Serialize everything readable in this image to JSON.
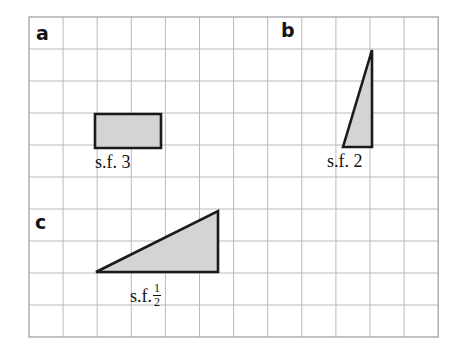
{
  "page": {
    "background_color": "#ffffff",
    "width": 454,
    "height": 355
  },
  "grid": {
    "name": "square-grid",
    "origin_x": 29,
    "origin_y": 17,
    "cell_size": 34.1,
    "cell_size_y": 32.0,
    "columns": 12,
    "rows": 10,
    "line_color": "#b9b9c4",
    "border_color": "#9a9aa6",
    "line_width": 1
  },
  "style": {
    "shape_fill": "#d4d4d4",
    "shape_stroke": "#1a1a1a",
    "shape_stroke_width": 2.6,
    "text_color": "#121212"
  },
  "parts": [
    {
      "id": "a",
      "letter": "a",
      "letter_x": 36,
      "letter_y": 24,
      "shape": {
        "type": "rectangle",
        "name": "shape-rectangle-a",
        "points": "95,114 161,114 161,148 95,148",
        "grid_width_cells": 2,
        "grid_height_cells": 1
      },
      "label": {
        "text": "s.f.",
        "value": "3",
        "fraction": null,
        "x": 95,
        "y": 153
      }
    },
    {
      "id": "b",
      "letter": "b",
      "letter_x": 281,
      "letter_y": 21,
      "shape": {
        "type": "triangle",
        "name": "shape-triangle-b",
        "points": "372,50 372,147 343,147",
        "grid_width_cells": 1,
        "grid_height_cells": 3
      },
      "label": {
        "text": "s.f.",
        "value": "2",
        "fraction": null,
        "x": 327,
        "y": 152
      }
    },
    {
      "id": "c",
      "letter": "c",
      "letter_x": 35,
      "letter_y": 213,
      "shape": {
        "type": "triangle",
        "name": "shape-triangle-c",
        "points": "96,272 218,272 218,211",
        "grid_width_cells": 4,
        "grid_height_cells": 2
      },
      "label": {
        "text": "s.f.",
        "value": "",
        "fraction": {
          "numerator": "1",
          "denominator": "2"
        },
        "x": 130,
        "y": 282
      }
    }
  ]
}
